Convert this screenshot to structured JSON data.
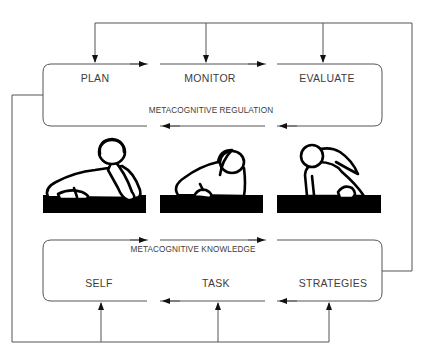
{
  "diagram": {
    "regulation": {
      "title": "METACOGNITIVE REGULATION",
      "stages": [
        "PLAN",
        "MONITOR",
        "EVALUATE"
      ]
    },
    "knowledge": {
      "title": "METACOGNITIVE KNOWLEDGE",
      "components": [
        "SELF",
        "TASK",
        "STRATEGIES"
      ]
    },
    "figures": [
      "student-leaning-thinking",
      "student-bent-writing",
      "student-ponytail-writing"
    ],
    "colors": {
      "line": "#333333",
      "text": "#3d3d3d",
      "desk": "#000000"
    }
  }
}
